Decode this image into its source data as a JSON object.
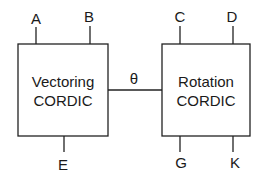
{
  "diagram": {
    "blocks": [
      {
        "id": "vectoring",
        "line1": "Vectoring",
        "line2": "CORDIC"
      },
      {
        "id": "rotation",
        "line1": "Rotation",
        "line2": "CORDIC"
      }
    ],
    "inputs": {
      "A": "A",
      "B": "B",
      "C": "C",
      "D": "D"
    },
    "outputs": {
      "E": "E",
      "G": "G",
      "K": "K"
    },
    "connection": {
      "label": "θ",
      "from": "vectoring",
      "to": "rotation"
    },
    "colors": {
      "line": "#222222",
      "background": "#ffffff"
    }
  }
}
